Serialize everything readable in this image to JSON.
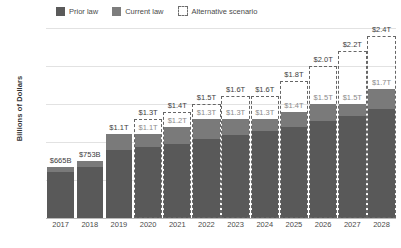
{
  "legend": {
    "items": [
      {
        "label": "Prior law",
        "key": "prior",
        "color": "#5a5a5a"
      },
      {
        "label": "Current law",
        "key": "current",
        "color": "#7d7d7d"
      },
      {
        "label": "Alternative scenario",
        "key": "alt",
        "color": "#ffffff"
      }
    ]
  },
  "axis": {
    "ylabel": "Billions of Dollars",
    "yticks": [
      "$2,500",
      "$2,000",
      "$1,500",
      "$1,000",
      "$500",
      "$0"
    ]
  },
  "chart_data": {
    "type": "bar",
    "title": "",
    "xlabel": "",
    "ylabel": "Billions of Dollars",
    "ylim": [
      0,
      2500
    ],
    "ytick_values": [
      0,
      500,
      1000,
      1500,
      2000,
      2500
    ],
    "grid": true,
    "legend_position": "top",
    "categories": [
      "2017",
      "2018",
      "2019",
      "2020",
      "2021",
      "2022",
      "2023",
      "2024",
      "2025",
      "2026",
      "2027",
      "2028"
    ],
    "series": [
      {
        "name": "Prior law",
        "values": [
          600,
          665,
          900,
          930,
          980,
          1040,
          1090,
          1140,
          1200,
          1270,
          1340,
          1430
        ]
      },
      {
        "name": "Current law",
        "values": [
          665,
          753,
          1100,
          1100,
          1200,
          1300,
          1300,
          1300,
          1400,
          1500,
          1500,
          1700
        ]
      },
      {
        "name": "Alternative scenario",
        "values": [
          null,
          null,
          null,
          1300,
          1400,
          1500,
          1600,
          1600,
          1800,
          2000,
          2200,
          2400
        ]
      }
    ],
    "bars": [
      {
        "year": "2017",
        "current_label": "$665B",
        "alt_label": null,
        "current_value": 665,
        "alt_value": null,
        "prior_value": 600,
        "has_alt_box": false
      },
      {
        "year": "2018",
        "current_label": "$753B",
        "alt_label": null,
        "current_value": 753,
        "alt_value": null,
        "prior_value": 665,
        "has_alt_box": false
      },
      {
        "year": "2019",
        "current_label": "$1.1T",
        "alt_label": null,
        "current_value": 1100,
        "alt_value": null,
        "prior_value": 900,
        "has_alt_box": false
      },
      {
        "year": "2020",
        "current_label": "$1.1T",
        "alt_label": "$1.3T",
        "current_value": 1100,
        "alt_value": 1300,
        "prior_value": 930,
        "has_alt_box": true
      },
      {
        "year": "2021",
        "current_label": "$1.2T",
        "alt_label": "$1.4T",
        "current_value": 1200,
        "alt_value": 1400,
        "prior_value": 980,
        "has_alt_box": true
      },
      {
        "year": "2022",
        "current_label": "$1.3T",
        "alt_label": "$1.5T",
        "current_value": 1300,
        "alt_value": 1500,
        "prior_value": 1040,
        "has_alt_box": true
      },
      {
        "year": "2023",
        "current_label": "$1.3T",
        "alt_label": "$1.6T",
        "current_value": 1300,
        "alt_value": 1600,
        "prior_value": 1090,
        "has_alt_box": true
      },
      {
        "year": "2024",
        "current_label": "$1.3T",
        "alt_label": "$1.6T",
        "current_value": 1300,
        "alt_value": 1600,
        "prior_value": 1140,
        "has_alt_box": true
      },
      {
        "year": "2025",
        "current_label": "$1.4T",
        "alt_label": "$1.8T",
        "current_value": 1400,
        "alt_value": 1800,
        "prior_value": 1200,
        "has_alt_box": true
      },
      {
        "year": "2026",
        "current_label": "$1.5T",
        "alt_label": "$2.0T",
        "current_value": 1500,
        "alt_value": 2000,
        "prior_value": 1270,
        "has_alt_box": true
      },
      {
        "year": "2027",
        "current_label": "$1.5T",
        "alt_label": "$2.2T",
        "current_value": 1500,
        "alt_value": 2200,
        "prior_value": 1340,
        "has_alt_box": true
      },
      {
        "year": "2028",
        "current_label": "$1.7T",
        "alt_label": "$2.4T",
        "current_value": 1700,
        "alt_value": 2400,
        "prior_value": 1430,
        "has_alt_box": true
      }
    ]
  },
  "colors": {
    "prior": "#595959",
    "current": "#7a7a7a",
    "alt_border": "#666666",
    "grid": "#e2e2e2",
    "axis": "#b9b9b9"
  }
}
